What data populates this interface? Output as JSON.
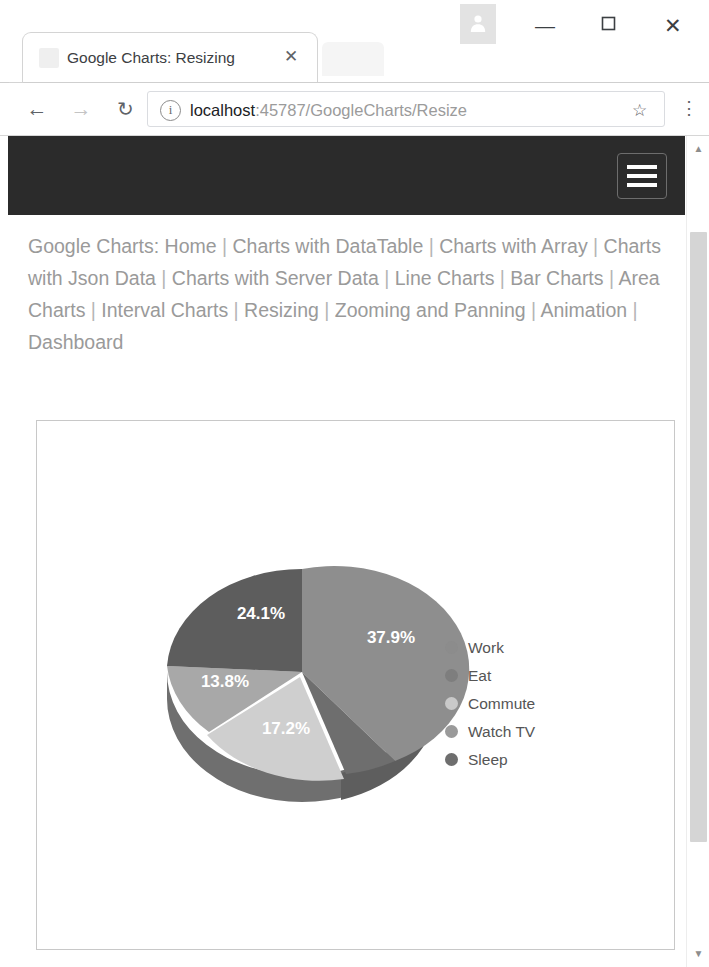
{
  "window": {
    "avatar_icon": "profile-avatar-icon",
    "minimize_label": "—",
    "maximize_label": "☐",
    "close_label": "✕"
  },
  "tab": {
    "title": "Google Charts: Resizing",
    "close_label": "✕",
    "favicon": "page-favicon"
  },
  "toolbar": {
    "back_label": "←",
    "forward_label": "→",
    "reload_label": "↻",
    "info_label": "i",
    "star_label": "☆",
    "menu_label": "⋮",
    "url_host": "localhost",
    "url_rest": ":45787/GoogleCharts/Resize",
    "url_full": "localhost:45787/GoogleCharts/Resize",
    "url_placeholder": "Search Google or type a URL"
  },
  "navbar": {
    "background": "#2b2b2b",
    "menu_toggle_label": "menu"
  },
  "nav_links": {
    "prefix": "Google Charts: ",
    "separator": " | ",
    "items": [
      "Home",
      "Charts with DataTable",
      "Charts with Array",
      "Charts with Json Data",
      "Charts with Server Data",
      "Line Charts",
      "Bar Charts",
      "Area Charts",
      "Interval Charts",
      "Resizing",
      "Zooming and Panning",
      "Animation",
      "Dashboard"
    ]
  },
  "scrollbar": {
    "up_label": "▲",
    "down_label": "▼"
  },
  "chart_data": {
    "type": "pie",
    "title": "",
    "subtitle": "",
    "xlabel": "",
    "ylabel": "",
    "is3d": true,
    "grid": false,
    "legend_position": "right",
    "labels_on_slices": true,
    "label_format": "percent",
    "categories": [
      "Work",
      "Eat",
      "Commute",
      "Watch TV",
      "Sleep"
    ],
    "values": [
      11,
      5,
      4,
      7,
      2
    ],
    "percent_labels": [
      "37.9%",
      "17.2%",
      "13.8%",
      "24.1%",
      "6.9%"
    ],
    "slice_colors": [
      "#8c8c8c",
      "#c9c9c9",
      "#a6a6a6",
      "#5a5a5a",
      "#767676"
    ],
    "legend": [
      {
        "label": "Work",
        "color": "#8c8c8c",
        "percent": "37.9%"
      },
      {
        "label": "Eat",
        "color": "#7e7e7e",
        "percent": "17.2%"
      },
      {
        "label": "Commute",
        "color": "#c9c9c9",
        "percent": "13.8%"
      },
      {
        "label": "Watch TV",
        "color": "#9a9a9a",
        "percent": "24.1%"
      },
      {
        "label": "Sleep",
        "color": "#6e6e6e",
        "percent": "6.9%"
      }
    ],
    "visible_slice_labels": [
      {
        "text": "37.9%",
        "x": 354,
        "y": 216
      },
      {
        "text": "24.1%",
        "x": 224,
        "y": 192
      },
      {
        "text": "13.8%",
        "x": 187,
        "y": 260
      },
      {
        "text": "17.2%",
        "x": 248,
        "y": 306
      }
    ]
  }
}
